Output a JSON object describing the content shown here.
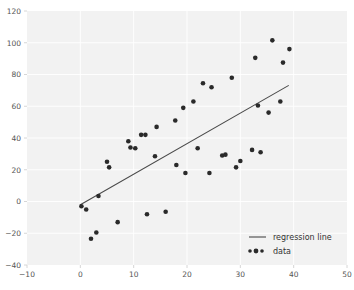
{
  "chart_data": {
    "type": "scatter",
    "title": "",
    "xlabel": "",
    "ylabel": "",
    "xlim": [
      -10,
      50
    ],
    "ylim": [
      -40,
      120
    ],
    "xticks": [
      -10,
      0,
      10,
      20,
      30,
      40,
      50
    ],
    "yticks": [
      -40,
      -20,
      0,
      20,
      40,
      60,
      80,
      100,
      120
    ],
    "grid": true,
    "legend_position": "lower right",
    "series": [
      {
        "name": "data",
        "type": "scatter",
        "marker": "circle",
        "color": "#2a2a2a",
        "points": [
          [
            0.2,
            -3.0
          ],
          [
            1.1,
            -5.0
          ],
          [
            2.0,
            -23.5
          ],
          [
            3.0,
            -19.5
          ],
          [
            3.4,
            3.5
          ],
          [
            5.0,
            25.0
          ],
          [
            5.4,
            21.5
          ],
          [
            7.0,
            -13.0
          ],
          [
            9.0,
            38.0
          ],
          [
            9.4,
            34.0
          ],
          [
            10.3,
            33.5
          ],
          [
            11.4,
            42.0
          ],
          [
            12.2,
            42.0
          ],
          [
            12.5,
            -8.0
          ],
          [
            14.0,
            28.5
          ],
          [
            14.3,
            47.0
          ],
          [
            16.0,
            -6.5
          ],
          [
            17.8,
            51.0
          ],
          [
            18.0,
            23.0
          ],
          [
            19.3,
            59.0
          ],
          [
            19.7,
            18.0
          ],
          [
            21.2,
            63.0
          ],
          [
            22.0,
            33.5
          ],
          [
            23.0,
            74.5
          ],
          [
            24.2,
            18.0
          ],
          [
            24.6,
            72.0
          ],
          [
            26.6,
            29.0
          ],
          [
            27.2,
            29.5
          ],
          [
            28.4,
            78.0
          ],
          [
            29.2,
            21.5
          ],
          [
            30.0,
            25.5
          ],
          [
            32.2,
            32.5
          ],
          [
            32.8,
            90.5
          ],
          [
            33.3,
            60.5
          ],
          [
            33.8,
            31.0
          ],
          [
            35.3,
            56.0
          ],
          [
            36.0,
            101.5
          ],
          [
            37.5,
            63.0
          ],
          [
            38.0,
            87.5
          ],
          [
            39.2,
            96.0
          ]
        ]
      },
      {
        "name": "regression line",
        "type": "line",
        "color": "#4a4a4a",
        "endpoints": [
          [
            0,
            -2.0
          ],
          [
            39,
            73.0
          ]
        ],
        "slope": 1.923,
        "intercept": -2.0
      }
    ],
    "legend_entries": [
      {
        "label": "regression line",
        "kind": "line",
        "color": "#4a4a4a"
      },
      {
        "label": "data",
        "kind": "marker",
        "color": "#2a2a2a"
      }
    ],
    "tick_label_color": "#555555",
    "axes_background": "#f2f2f2",
    "grid_color": "#ffffff",
    "figure_background": "#ffffff"
  },
  "axis": {
    "x_tick_labels": [
      "-10",
      "0",
      "10",
      "20",
      "30",
      "40",
      "50"
    ],
    "y_tick_labels": [
      "-40",
      "-20",
      "0",
      "20",
      "40",
      "60",
      "80",
      "100",
      "120"
    ]
  },
  "legend": {
    "items": [
      {
        "label": "regression line"
      },
      {
        "label": "data"
      }
    ]
  }
}
